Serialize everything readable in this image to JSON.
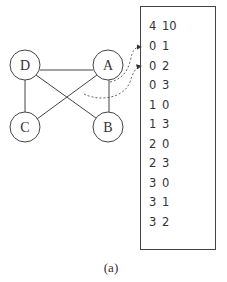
{
  "figure": {
    "caption": "(a)",
    "graph": {
      "nodes": [
        {
          "id": "D",
          "label": "D",
          "cx": 25,
          "cy": 65
        },
        {
          "id": "A",
          "label": "A",
          "cx": 108,
          "cy": 65
        },
        {
          "id": "C",
          "label": "C",
          "cx": 25,
          "cy": 127
        },
        {
          "id": "B",
          "label": "B",
          "cx": 108,
          "cy": 127
        }
      ],
      "edges": [
        [
          "D",
          "A"
        ],
        [
          "D",
          "C"
        ],
        [
          "D",
          "B"
        ],
        [
          "A",
          "C"
        ],
        [
          "A",
          "B"
        ]
      ]
    },
    "edge_list_box": {
      "rows": [
        {
          "a": "4",
          "b": "10"
        },
        {
          "a": "0",
          "b": "1"
        },
        {
          "a": "0",
          "b": "2"
        },
        {
          "a": "0",
          "b": "3"
        },
        {
          "a": "1",
          "b": "0"
        },
        {
          "a": "1",
          "b": "3"
        },
        {
          "a": "2",
          "b": "0"
        },
        {
          "a": "2",
          "b": "3"
        },
        {
          "a": "3",
          "b": "0"
        },
        {
          "a": "3",
          "b": "1"
        },
        {
          "a": "3",
          "b": "2"
        }
      ]
    },
    "colors": {
      "stroke": "#444444",
      "text": "#333333"
    }
  }
}
